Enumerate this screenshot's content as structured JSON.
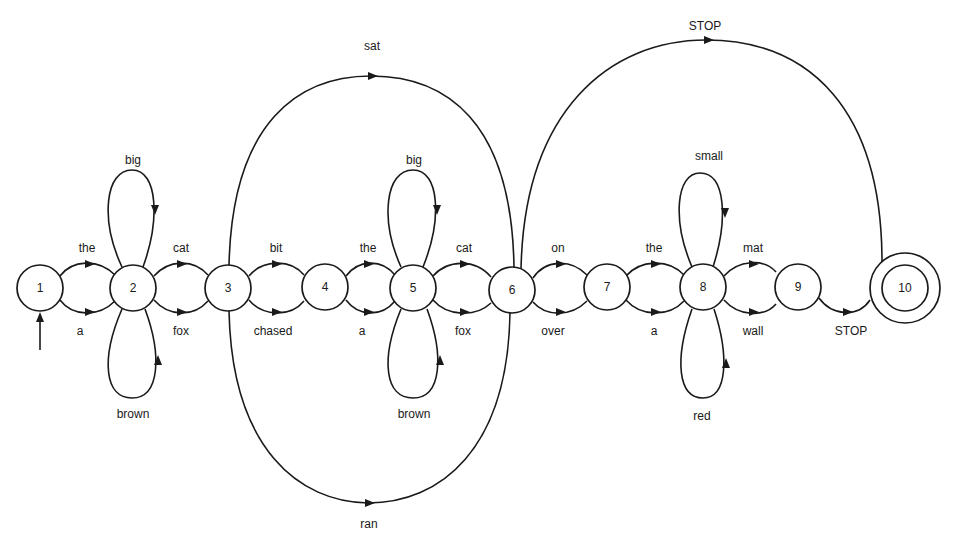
{
  "diagram": {
    "type": "finite-state transition network",
    "nodes": [
      {
        "id": "1",
        "label": "1",
        "start": true
      },
      {
        "id": "2",
        "label": "2"
      },
      {
        "id": "3",
        "label": "3"
      },
      {
        "id": "4",
        "label": "4"
      },
      {
        "id": "5",
        "label": "5"
      },
      {
        "id": "6",
        "label": "6"
      },
      {
        "id": "7",
        "label": "7"
      },
      {
        "id": "8",
        "label": "8"
      },
      {
        "id": "9",
        "label": "9"
      },
      {
        "id": "10",
        "label": "10",
        "final": true
      }
    ],
    "edges": [
      {
        "from": "1",
        "to": "2",
        "label": "the"
      },
      {
        "from": "1",
        "to": "2",
        "label": "a"
      },
      {
        "from": "2",
        "to": "2",
        "label": "big"
      },
      {
        "from": "2",
        "to": "2",
        "label": "brown"
      },
      {
        "from": "2",
        "to": "3",
        "label": "cat"
      },
      {
        "from": "2",
        "to": "3",
        "label": "fox"
      },
      {
        "from": "3",
        "to": "4",
        "label": "bit"
      },
      {
        "from": "3",
        "to": "4",
        "label": "chased"
      },
      {
        "from": "3",
        "to": "6",
        "label": "sat"
      },
      {
        "from": "3",
        "to": "6",
        "label": "ran"
      },
      {
        "from": "4",
        "to": "5",
        "label": "the"
      },
      {
        "from": "4",
        "to": "5",
        "label": "a"
      },
      {
        "from": "5",
        "to": "5",
        "label": "big"
      },
      {
        "from": "5",
        "to": "5",
        "label": "brown"
      },
      {
        "from": "5",
        "to": "6",
        "label": "cat"
      },
      {
        "from": "5",
        "to": "6",
        "label": "fox"
      },
      {
        "from": "6",
        "to": "7",
        "label": "on"
      },
      {
        "from": "6",
        "to": "7",
        "label": "over"
      },
      {
        "from": "6",
        "to": "10",
        "label": "STOP"
      },
      {
        "from": "7",
        "to": "8",
        "label": "the"
      },
      {
        "from": "7",
        "to": "8",
        "label": "a"
      },
      {
        "from": "8",
        "to": "8",
        "label": "small"
      },
      {
        "from": "8",
        "to": "8",
        "label": "red"
      },
      {
        "from": "8",
        "to": "9",
        "label": "mat"
      },
      {
        "from": "8",
        "to": "9",
        "label": "wall"
      },
      {
        "from": "9",
        "to": "10",
        "label": "STOP"
      }
    ]
  }
}
